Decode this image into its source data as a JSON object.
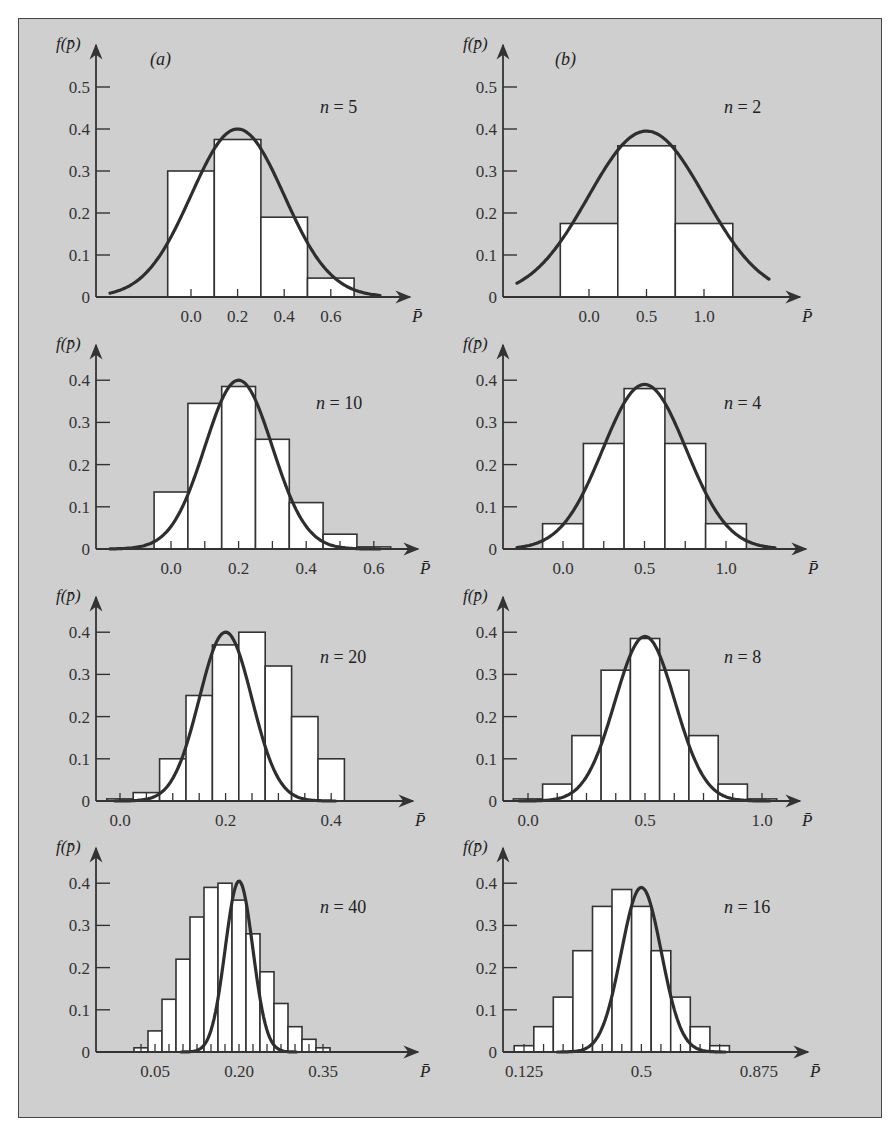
{
  "figure": {
    "column_labels": [
      "(a)",
      "(b)"
    ],
    "y_axis_title": "f(p̄)",
    "x_axis_title": "P̄",
    "colors": {
      "background": "#cfcfcf",
      "bar_fill": "#ffffff",
      "line": "#333333",
      "curve": "#2e2e2e"
    }
  },
  "chart_data": [
    {
      "type": "bar",
      "panel": "a",
      "title": "n = 5",
      "n": 5,
      "p": 0.2,
      "xlabel": "P̄",
      "ylabel": "f(p̄)",
      "yticks": [
        0,
        0.1,
        0.2,
        0.3,
        0.4,
        0.5
      ],
      "ytick_labels": [
        "0",
        "0.1",
        "0.2",
        "0.3",
        "0.4",
        "0.5"
      ],
      "xtick_labels": [
        "0.0",
        "0.2",
        "0.4",
        "0.6"
      ],
      "xticks": [
        0.0,
        0.2,
        0.4,
        0.6
      ],
      "minor_xticks": [
        0.0,
        0.2,
        0.4,
        0.6,
        0.8
      ],
      "ylim": [
        0,
        0.55
      ],
      "bin_width": 0.2,
      "bins": [
        {
          "center": 0.0,
          "value": 0.3
        },
        {
          "center": 0.2,
          "value": 0.375
        },
        {
          "center": 0.4,
          "value": 0.19
        },
        {
          "center": 0.6,
          "value": 0.045
        }
      ],
      "curve": {
        "type": "normal",
        "mean": 0.2,
        "peak": 0.4
      },
      "grid": false
    },
    {
      "type": "bar",
      "panel": "b",
      "title": "n = 2",
      "n": 2,
      "p": 0.5,
      "xlabel": "P̄",
      "ylabel": "f(p̄)",
      "yticks": [
        0,
        0.1,
        0.2,
        0.3,
        0.4,
        0.5
      ],
      "ytick_labels": [
        "0",
        "0.1",
        "0.2",
        "0.3",
        "0.4",
        "0.5"
      ],
      "xtick_labels": [
        "0.0",
        "0.5",
        "1.0"
      ],
      "xticks": [
        0.0,
        0.5,
        1.0
      ],
      "ylim": [
        0,
        0.55
      ],
      "bin_width": 0.5,
      "bins": [
        {
          "center": 0.0,
          "value": 0.175
        },
        {
          "center": 0.5,
          "value": 0.36
        },
        {
          "center": 1.0,
          "value": 0.175
        }
      ],
      "curve": {
        "type": "normal",
        "mean": 0.5,
        "peak": 0.395
      },
      "grid": false
    },
    {
      "type": "bar",
      "panel": "a",
      "title": "n = 10",
      "n": 10,
      "p": 0.2,
      "xlabel": "P̄",
      "ylabel": "f(p̄)",
      "yticks": [
        0,
        0.1,
        0.2,
        0.3,
        0.4
      ],
      "ytick_labels": [
        "0",
        "0.1",
        "0.2",
        "0.3",
        "0.4"
      ],
      "xtick_labels": [
        "0.0",
        "0.2",
        "0.4",
        "0.6"
      ],
      "xticks": [
        0.0,
        0.2,
        0.4,
        0.6
      ],
      "ylim": [
        0,
        0.45
      ],
      "bin_width": 0.1,
      "bins": [
        {
          "center": 0.0,
          "value": 0.135
        },
        {
          "center": 0.1,
          "value": 0.345
        },
        {
          "center": 0.2,
          "value": 0.385
        },
        {
          "center": 0.3,
          "value": 0.26
        },
        {
          "center": 0.4,
          "value": 0.11
        },
        {
          "center": 0.5,
          "value": 0.035
        },
        {
          "center": 0.6,
          "value": 0.005
        }
      ],
      "curve": {
        "type": "normal",
        "mean": 0.2,
        "peak": 0.4
      },
      "grid": false
    },
    {
      "type": "bar",
      "panel": "b",
      "title": "n = 4",
      "n": 4,
      "p": 0.5,
      "xlabel": "P̄",
      "ylabel": "f(p̄)",
      "yticks": [
        0,
        0.1,
        0.2,
        0.3,
        0.4
      ],
      "ytick_labels": [
        "0",
        "0.1",
        "0.2",
        "0.3",
        "0.4"
      ],
      "xtick_labels": [
        "0.0",
        "0.5",
        "1.0"
      ],
      "xticks": [
        0.0,
        0.5,
        1.0
      ],
      "ylim": [
        0,
        0.45
      ],
      "bin_width": 0.25,
      "bins": [
        {
          "center": 0.0,
          "value": 0.06
        },
        {
          "center": 0.25,
          "value": 0.25
        },
        {
          "center": 0.5,
          "value": 0.38
        },
        {
          "center": 0.75,
          "value": 0.25
        },
        {
          "center": 1.0,
          "value": 0.06
        }
      ],
      "curve": {
        "type": "normal",
        "mean": 0.5,
        "peak": 0.39
      },
      "grid": false
    },
    {
      "type": "bar",
      "panel": "a",
      "title": "n = 20",
      "n": 20,
      "p": 0.2,
      "xlabel": "P̄",
      "ylabel": "f(p̄)",
      "yticks": [
        0,
        0.1,
        0.2,
        0.3,
        0.4
      ],
      "ytick_labels": [
        "0",
        "0.1",
        "0.2",
        "0.3",
        "0.4"
      ],
      "xtick_labels": [
        "0.0",
        "0.2",
        "0.4"
      ],
      "xticks": [
        0.0,
        0.2,
        0.4
      ],
      "ylim": [
        0,
        0.45
      ],
      "bin_width": 0.05,
      "bins": [
        {
          "center": 0.0,
          "value": 0.005
        },
        {
          "center": 0.05,
          "value": 0.02
        },
        {
          "center": 0.1,
          "value": 0.1
        },
        {
          "center": 0.15,
          "value": 0.25
        },
        {
          "center": 0.2,
          "value": 0.37
        },
        {
          "center": 0.25,
          "value": 0.4
        },
        {
          "center": 0.3,
          "value": 0.32
        },
        {
          "center": 0.35,
          "value": 0.2
        },
        {
          "center": 0.4,
          "value": 0.1
        }
      ],
      "bins_note": "bars drawn at tick positions; rightmost tail bars ~0.04 and ~0.01",
      "curve": {
        "type": "normal",
        "mean": 0.2,
        "peak": 0.4
      },
      "grid": false
    },
    {
      "type": "bar",
      "panel": "b",
      "title": "n = 8",
      "n": 8,
      "p": 0.5,
      "xlabel": "P̄",
      "ylabel": "f(p̄)",
      "yticks": [
        0,
        0.1,
        0.2,
        0.3,
        0.4
      ],
      "ytick_labels": [
        "0",
        "0.1",
        "0.2",
        "0.3",
        "0.4"
      ],
      "xtick_labels": [
        "0.0",
        "0.5",
        "1.0"
      ],
      "xticks": [
        0.0,
        0.5,
        1.0
      ],
      "ylim": [
        0,
        0.45
      ],
      "bin_width": 0.125,
      "bins": [
        {
          "center": 0.0,
          "value": 0.005
        },
        {
          "center": 0.125,
          "value": 0.04
        },
        {
          "center": 0.25,
          "value": 0.155
        },
        {
          "center": 0.375,
          "value": 0.31
        },
        {
          "center": 0.5,
          "value": 0.385
        },
        {
          "center": 0.625,
          "value": 0.31
        },
        {
          "center": 0.75,
          "value": 0.155
        },
        {
          "center": 0.875,
          "value": 0.04
        },
        {
          "center": 1.0,
          "value": 0.005
        }
      ],
      "curve": {
        "type": "normal",
        "mean": 0.5,
        "peak": 0.39
      },
      "grid": false
    },
    {
      "type": "bar",
      "panel": "a",
      "title": "n = 40",
      "n": 40,
      "p": 0.2,
      "xlabel": "P̄",
      "ylabel": "f(p̄)",
      "yticks": [
        0,
        0.1,
        0.2,
        0.3,
        0.4
      ],
      "ytick_labels": [
        "0",
        "0.1",
        "0.2",
        "0.3",
        "0.4"
      ],
      "xtick_labels": [
        "0.05",
        "0.20",
        "0.35"
      ],
      "xticks": [
        0.05,
        0.2,
        0.35
      ],
      "ylim": [
        0,
        0.45
      ],
      "bin_width": 0.025,
      "bins": [
        {
          "center": 0.025,
          "value": 0.01
        },
        {
          "center": 0.05,
          "value": 0.05
        },
        {
          "center": 0.075,
          "value": 0.125
        },
        {
          "center": 0.1,
          "value": 0.22
        },
        {
          "center": 0.125,
          "value": 0.32
        },
        {
          "center": 0.15,
          "value": 0.39
        },
        {
          "center": 0.175,
          "value": 0.4
        },
        {
          "center": 0.2,
          "value": 0.36
        },
        {
          "center": 0.225,
          "value": 0.28
        },
        {
          "center": 0.25,
          "value": 0.19
        },
        {
          "center": 0.275,
          "value": 0.115
        },
        {
          "center": 0.3,
          "value": 0.06
        },
        {
          "center": 0.325,
          "value": 0.03
        },
        {
          "center": 0.35,
          "value": 0.01
        }
      ],
      "curve": {
        "type": "normal",
        "mean": 0.2,
        "peak": 0.405
      },
      "grid": false
    },
    {
      "type": "bar",
      "panel": "b",
      "title": "n = 16",
      "n": 16,
      "p": 0.5,
      "xlabel": "P̄",
      "ylabel": "f(p̄)",
      "yticks": [
        0,
        0.1,
        0.2,
        0.3,
        0.4
      ],
      "ytick_labels": [
        "0",
        "0.1",
        "0.2",
        "0.3",
        "0.4"
      ],
      "xtick_labels": [
        "0.125",
        "0.5",
        "0.875"
      ],
      "xticks": [
        0.125,
        0.5,
        0.875
      ],
      "ylim": [
        0,
        0.45
      ],
      "bin_width": 0.0625,
      "bins": [
        {
          "center": 0.125,
          "value": 0.015
        },
        {
          "center": 0.1875,
          "value": 0.06
        },
        {
          "center": 0.25,
          "value": 0.13
        },
        {
          "center": 0.3125,
          "value": 0.24
        },
        {
          "center": 0.375,
          "value": 0.345
        },
        {
          "center": 0.4375,
          "value": 0.385
        },
        {
          "center": 0.5,
          "value": 0.345
        },
        {
          "center": 0.5625,
          "value": 0.24
        },
        {
          "center": 0.625,
          "value": 0.13
        },
        {
          "center": 0.6875,
          "value": 0.06
        },
        {
          "center": 0.75,
          "value": 0.015
        }
      ],
      "curve": {
        "type": "normal",
        "mean": 0.5,
        "peak": 0.39
      },
      "grid": false
    }
  ]
}
